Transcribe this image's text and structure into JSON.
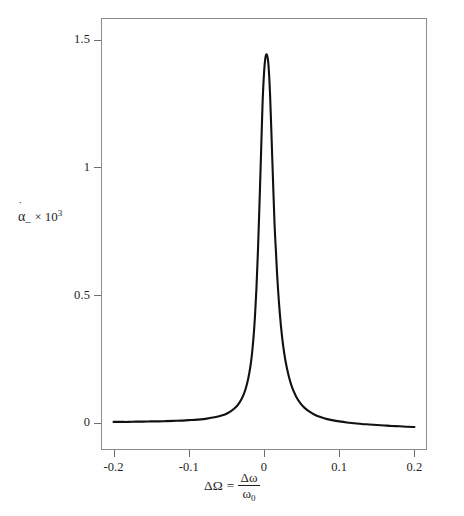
{
  "figure": {
    "kind": "scientific-plot",
    "background_color": "#fefefe",
    "frame_color": "#8c8c8c",
    "curve_color": "#111111",
    "caption_text": ""
  },
  "axes": {
    "y": {
      "label_symbol": "α",
      "label_hat": "˙",
      "label_subscript": "–",
      "label_times": "×",
      "label_mantissa": "10",
      "label_exponent": "3",
      "ticks": [
        {
          "value": 0,
          "text": "0"
        },
        {
          "value": 0.5,
          "text": "0.5"
        },
        {
          "value": 1,
          "text": "1"
        },
        {
          "value": 1.5,
          "text": "1.5"
        }
      ]
    },
    "x": {
      "label_lhs": "ΔΩ",
      "label_eq": "=",
      "label_numerator": "Δω",
      "label_denominator": "ω",
      "label_denominator_sub": "0",
      "ticks": [
        {
          "value": -0.2,
          "text": "-0.2"
        },
        {
          "value": -0.1,
          "text": "-0.1"
        },
        {
          "value": 0,
          "text": "0"
        },
        {
          "value": 0.1,
          "text": "0.1"
        },
        {
          "value": 0.2,
          "text": "0.2"
        }
      ]
    }
  },
  "chart_data": {
    "type": "line",
    "title": "",
    "xlabel": "ΔΩ = Δω/ω₀",
    "ylabel": "α̇– × 10³",
    "xlim": [
      -0.2167,
      0.2167
    ],
    "ylim": [
      -0.107,
      1.585
    ],
    "grid": false,
    "legend": null,
    "annotations": [],
    "series": [
      {
        "name": "resonance lineshape",
        "color": "#111111",
        "peak_value": 1.44,
        "peak_x": 0.004,
        "half_width_half_max": 0.007,
        "x": [
          -0.2,
          -0.19,
          -0.18,
          -0.17,
          -0.16,
          -0.15,
          -0.14,
          -0.13,
          -0.12,
          -0.11,
          -0.1,
          -0.092,
          -0.084,
          -0.076,
          -0.068,
          -0.06,
          -0.054,
          -0.048,
          -0.043,
          -0.038,
          -0.034,
          -0.03,
          -0.027,
          -0.024,
          -0.021,
          -0.018,
          -0.016,
          -0.014,
          -0.012,
          -0.01,
          -0.008,
          -0.006,
          -0.004,
          -0.002,
          0.0,
          0.002,
          0.004,
          0.006,
          0.008,
          0.01,
          0.012,
          0.014,
          0.016,
          0.018,
          0.021,
          0.024,
          0.027,
          0.03,
          0.034,
          0.038,
          0.043,
          0.048,
          0.054,
          0.06,
          0.068,
          0.076,
          0.084,
          0.092,
          0.1,
          0.11,
          0.12,
          0.13,
          0.14,
          0.15,
          0.16,
          0.17,
          0.18,
          0.19,
          0.2
        ],
        "y": [
          0.003,
          0.003,
          0.003,
          0.004,
          0.004,
          0.005,
          0.005,
          0.006,
          0.007,
          0.008,
          0.01,
          0.011,
          0.013,
          0.016,
          0.02,
          0.025,
          0.03,
          0.038,
          0.047,
          0.059,
          0.073,
          0.092,
          0.111,
          0.137,
          0.172,
          0.222,
          0.269,
          0.332,
          0.416,
          0.53,
          0.676,
          0.857,
          1.048,
          1.243,
          1.367,
          1.432,
          1.44,
          1.399,
          1.289,
          1.123,
          0.947,
          0.779,
          0.663,
          0.553,
          0.429,
          0.337,
          0.27,
          0.22,
          0.17,
          0.133,
          0.101,
          0.078,
          0.058,
          0.044,
          0.03,
          0.021,
          0.014,
          0.009,
          0.005,
          0.001,
          -0.002,
          -0.005,
          -0.007,
          -0.009,
          -0.011,
          -0.013,
          -0.014,
          -0.016,
          -0.017
        ]
      }
    ]
  }
}
